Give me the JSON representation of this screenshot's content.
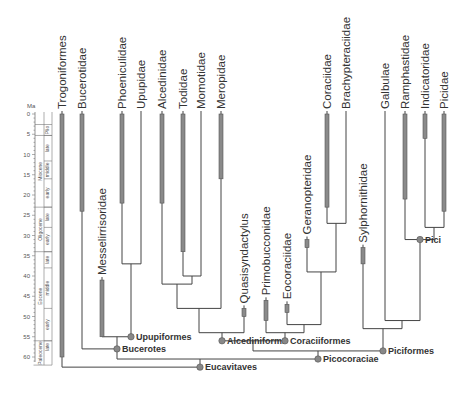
{
  "figure": {
    "type": "time-calibrated phylogeny",
    "time_axis": {
      "unit_label": "Ma",
      "ticks": [
        0,
        5,
        10,
        15,
        20,
        25,
        30,
        35,
        40,
        45,
        50,
        55,
        60
      ],
      "y0": 114,
      "px_per_ma": 4.05
    },
    "epochs": [
      {
        "name": "Plio",
        "from": 2.6,
        "to": 5.3
      },
      {
        "name": "Miocene",
        "from": 5.3,
        "to": 23
      },
      {
        "name": "Oligocene",
        "from": 23,
        "to": 34
      },
      {
        "name": "Eocene",
        "from": 34,
        "to": 56
      },
      {
        "name": "Paleocene",
        "from": 56,
        "to": 62
      }
    ],
    "subdivisions": [
      {
        "name": "late",
        "from": 5.3,
        "to": 11.6
      },
      {
        "name": "middle",
        "from": 11.6,
        "to": 16
      },
      {
        "name": "early",
        "from": 16,
        "to": 23
      },
      {
        "name": "late",
        "from": 23,
        "to": 28
      },
      {
        "name": "early",
        "from": 28,
        "to": 34
      },
      {
        "name": "late",
        "from": 34,
        "to": 38
      },
      {
        "name": "middle",
        "from": 38,
        "to": 48
      },
      {
        "name": "early",
        "from": 48,
        "to": 56
      },
      {
        "name": "late",
        "from": 56,
        "to": 59
      }
    ],
    "taxa": [
      {
        "name": "Trogoniformes",
        "x": 62,
        "bar_from": 0,
        "bar_to": 60,
        "line_to": 62.5
      },
      {
        "name": "Bucerotidae",
        "x": 82,
        "bar_from": 0,
        "bar_to": 24,
        "line_to": 58
      },
      {
        "name": "Messelirrisoridae",
        "x": 102,
        "bar_from": 41,
        "bar_to": 55,
        "line_to": 55
      },
      {
        "name": "Phoeniculidae",
        "x": 122,
        "bar_from": 0,
        "bar_to": 22,
        "line_to": 37
      },
      {
        "name": "Upupidae",
        "x": 141,
        "bar_from": null,
        "bar_to": null,
        "line_to": 37
      },
      {
        "name": "Alcedinidae",
        "x": 162,
        "bar_from": 0,
        "bar_to": 22,
        "line_to": 42
      },
      {
        "name": "Todidae",
        "x": 183,
        "bar_from": 0,
        "bar_to": 34,
        "line_to": 40
      },
      {
        "name": "Momotidae",
        "x": 201,
        "bar_from": null,
        "bar_to": null,
        "line_to": 40
      },
      {
        "name": "Meropidae",
        "x": 221,
        "bar_from": 0,
        "bar_to": 16,
        "line_to": 48
      },
      {
        "name": "Quasisyndactylus",
        "x": 244,
        "bar_from": 48,
        "bar_to": 50,
        "line_to": 54
      },
      {
        "name": "Primobucconidae",
        "x": 266,
        "bar_from": 46,
        "bar_to": 51,
        "line_to": 54
      },
      {
        "name": "Eocoraciidae",
        "x": 287,
        "bar_from": 47,
        "bar_to": 49,
        "line_to": 52
      },
      {
        "name": "Geranopteridae",
        "x": 307,
        "bar_from": 31,
        "bar_to": 33,
        "line_to": 39
      },
      {
        "name": "Coraciidae",
        "x": 327,
        "bar_from": 0,
        "bar_to": 23,
        "line_to": 27
      },
      {
        "name": "Brachypteraciidae",
        "x": 346,
        "bar_from": null,
        "bar_to": null,
        "line_to": 27
      },
      {
        "name": "Sylphornithidae",
        "x": 363,
        "bar_from": 33,
        "bar_to": 37,
        "line_to": 53
      },
      {
        "name": "Galbulae",
        "x": 385,
        "bar_from": null,
        "bar_to": null,
        "line_to": 51
      },
      {
        "name": "Ramphastidae",
        "x": 405,
        "bar_from": 0,
        "bar_to": 21,
        "line_to": 31
      },
      {
        "name": "Indicatoridae",
        "x": 425,
        "bar_from": 0,
        "bar_to": 6,
        "line_to": 28
      },
      {
        "name": "Picidae",
        "x": 444,
        "bar_from": 0,
        "bar_to": 24,
        "line_to": 28
      }
    ],
    "nodes": [
      {
        "name": "Upupiformes",
        "labelled": true
      },
      {
        "name": "Bucerotes",
        "labelled": true
      },
      {
        "name": "Alcediniform.",
        "labelled": true
      },
      {
        "name": "Coraciiformes",
        "labelled": true
      },
      {
        "name": "Picocoraciae",
        "labelled": true
      },
      {
        "name": "Eucavitaves",
        "labelled": true
      },
      {
        "name": "Piciformes",
        "labelled": true
      },
      {
        "name": "Pici",
        "labelled": true
      }
    ],
    "colors": {
      "line": "#444444",
      "bar_fill": "#8a8a8a",
      "bar_stroke": "#555555",
      "node_fill": "#888888",
      "text": "#333333"
    }
  }
}
